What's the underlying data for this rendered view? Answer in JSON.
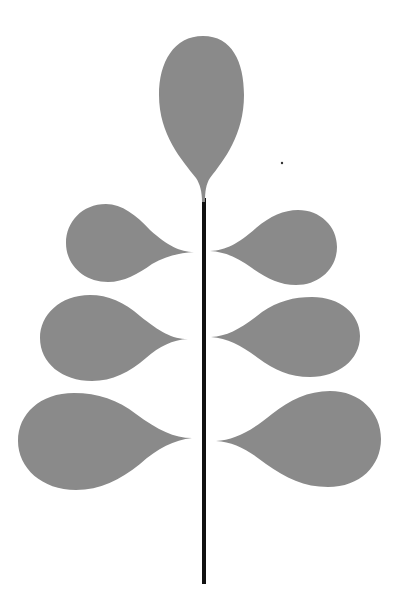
{
  "image": {
    "description": "Stylized leaf illustration: vertical black stem with a teardrop leaf on top and three pairs of teardrop leaves on each side",
    "colors": {
      "background": "#ffffff",
      "leaf": "#8a8a8a",
      "stem": "#111111"
    },
    "elements": {
      "stem": {
        "x": 204,
        "y_top": 200,
        "y_bottom": 584,
        "width": 4
      },
      "top_leaf": {
        "cx": 203,
        "top": 36,
        "bottom": 200
      },
      "left_leaves": [
        {
          "tip_x": 194,
          "tip_y": 252,
          "round_left": 66,
          "top": 204,
          "bottom": 282
        },
        {
          "tip_x": 188,
          "tip_y": 339,
          "round_left": 40,
          "top": 295,
          "bottom": 381
        },
        {
          "tip_x": 192,
          "tip_y": 438,
          "round_left": 18,
          "top": 393,
          "bottom": 490
        }
      ],
      "right_leaves": [
        {
          "tip_x": 210,
          "tip_y": 251,
          "round_right": 337,
          "top": 210,
          "bottom": 285
        },
        {
          "tip_x": 211,
          "tip_y": 337,
          "round_right": 360,
          "top": 297,
          "bottom": 377
        },
        {
          "tip_x": 216,
          "tip_y": 441,
          "round_right": 381,
          "top": 391,
          "bottom": 487
        }
      ],
      "speck": {
        "x": 282,
        "y": 163
      }
    }
  }
}
